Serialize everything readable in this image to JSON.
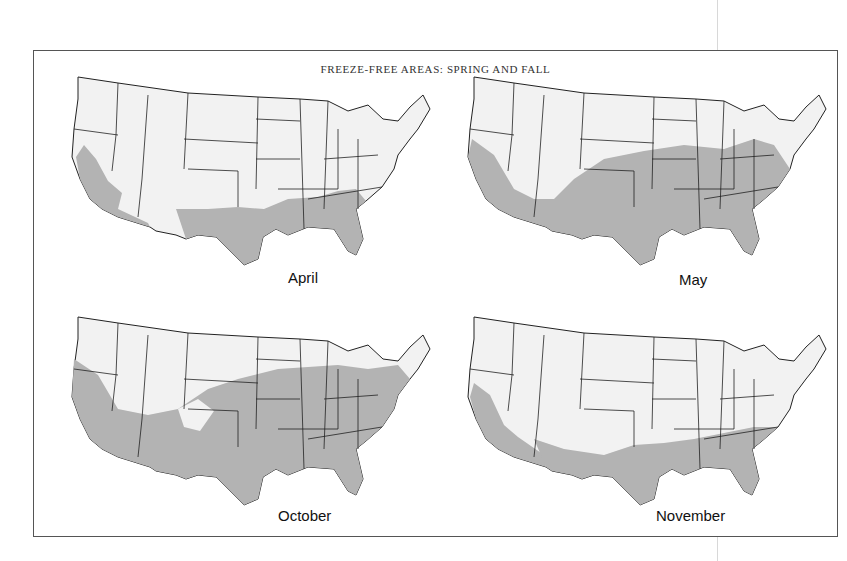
{
  "title": "FREEZE-FREE AREAS: SPRING AND FALL",
  "legend": {
    "shaded_meaning": "freeze-free area",
    "shaded_color": "#b3b3b3",
    "land_color": "#f2f2f2",
    "border_color": "#222222"
  },
  "maps": [
    {
      "id": "april",
      "label": "April",
      "season": "spring",
      "coverage": "Gulf Coast, Southeast coastal plain, southern/central California, southern Arizona, south and central Texas, Florida"
    },
    {
      "id": "may",
      "label": "May",
      "season": "spring",
      "coverage": "Most of southern half of US: California lowlands, Arizona, Texas, Oklahoma, Kansas, Missouri, Arkansas, Southeast, Ohio Valley, Mid-Atlantic"
    },
    {
      "id": "october",
      "label": "October",
      "season": "fall",
      "coverage": "Most of central and eastern US south of the Great Lakes, Pacific coast, Southwest lowlands, Mid-Atlantic and southern New England"
    },
    {
      "id": "november",
      "label": "November",
      "season": "fall",
      "coverage": "Gulf Coast, Southeast, Florida, southern Texas, southern Arizona, California valleys and coast"
    }
  ]
}
